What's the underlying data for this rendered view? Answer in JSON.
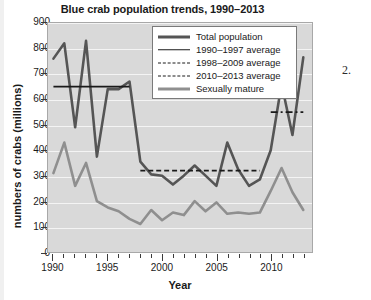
{
  "chart_data": {
    "type": "line",
    "title": "Blue crab population trends, 1990–2013",
    "xlabel": "Year",
    "ylabel": "numbers of crabs (millions)",
    "xlim": [
      1989.5,
      2013.8
    ],
    "ylim": [
      0,
      900
    ],
    "ytick_values": [
      0,
      100,
      200,
      300,
      400,
      500,
      600,
      700,
      800,
      900
    ],
    "ytick_labels": [
      "0",
      "100",
      "200",
      "300",
      "400",
      "500",
      "600",
      "700",
      "800",
      "900"
    ],
    "xtick_values": [
      1990,
      1995,
      2000,
      2005,
      2010
    ],
    "xtick_labels": [
      "1990",
      "1995",
      "2000",
      "2005",
      "2010"
    ],
    "xtick_minor_values": [
      1991,
      1992,
      1993,
      1994,
      1996,
      1997,
      1998,
      1999,
      2001,
      2002,
      2003,
      2004,
      2006,
      2007,
      2008,
      2009,
      2011,
      2012,
      2013
    ],
    "grid": "horizontal-white",
    "plot_background": "#d9d9d9",
    "legend_position": "upper-center-right",
    "x": [
      1990,
      1991,
      1992,
      1993,
      1994,
      1995,
      1996,
      1997,
      1998,
      1999,
      2000,
      2001,
      2002,
      2003,
      2004,
      2005,
      2006,
      2007,
      2008,
      2009,
      2010,
      2011,
      2012,
      2013
    ],
    "series": [
      {
        "name": "Total population",
        "color": "#555555",
        "style": "solid",
        "width": 2.6,
        "values": [
          760,
          820,
          490,
          830,
          375,
          640,
          640,
          670,
          355,
          305,
          300,
          265,
          300,
          340,
          300,
          260,
          430,
          325,
          260,
          285,
          400,
          660,
          460,
          765
        ]
      },
      {
        "name": "Sexually mature",
        "color": "#8f8f8f",
        "style": "solid",
        "width": 2.6,
        "values": [
          310,
          430,
          260,
          350,
          200,
          175,
          160,
          130,
          110,
          165,
          125,
          155,
          145,
          200,
          160,
          195,
          150,
          155,
          150,
          155,
          240,
          330,
          235,
          165
        ]
      }
    ],
    "reference_lines": [
      {
        "name": "1990–1997 average",
        "value": 650,
        "x_start": 1990,
        "x_end": 1997,
        "style": "solid",
        "color": "#1a1a1a",
        "width": 1.8
      },
      {
        "name": "1998–2009 average",
        "value": 320,
        "x_start": 1998,
        "x_end": 2009,
        "style": "dashed",
        "color": "#1a1a1a",
        "width": 1.8
      },
      {
        "name": "2010–2013 average",
        "value": 550,
        "x_start": 2010,
        "x_end": 2013,
        "style": "dashdot",
        "color": "#1a1a1a",
        "width": 1.8
      }
    ],
    "legend": [
      {
        "label": "Total population",
        "swatch": "sw-total"
      },
      {
        "label": "1990–1997 average",
        "swatch": "sw-avg9097"
      },
      {
        "label": "1998–2009 average",
        "swatch": "sw-avg9809"
      },
      {
        "label": "2010–2013 average",
        "swatch": "sw-avg1013"
      },
      {
        "label": "Sexually mature",
        "swatch": "sw-mature"
      }
    ]
  },
  "annotation": {
    "margin_note": "2."
  }
}
